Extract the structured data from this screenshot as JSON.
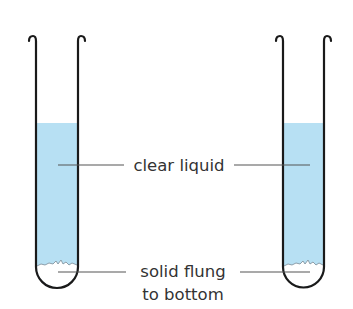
{
  "diagram": {
    "labels": {
      "clear_liquid": "clear liquid",
      "solid_line1": "solid flung",
      "solid_line2": "to bottom"
    },
    "colors": {
      "liquid": "#b7e0f3",
      "tube_outline": "#1a1a1a",
      "leader_line": "#555555",
      "text": "#333333"
    },
    "tubes": [
      {
        "name": "left-tube"
      },
      {
        "name": "right-tube"
      }
    ]
  }
}
